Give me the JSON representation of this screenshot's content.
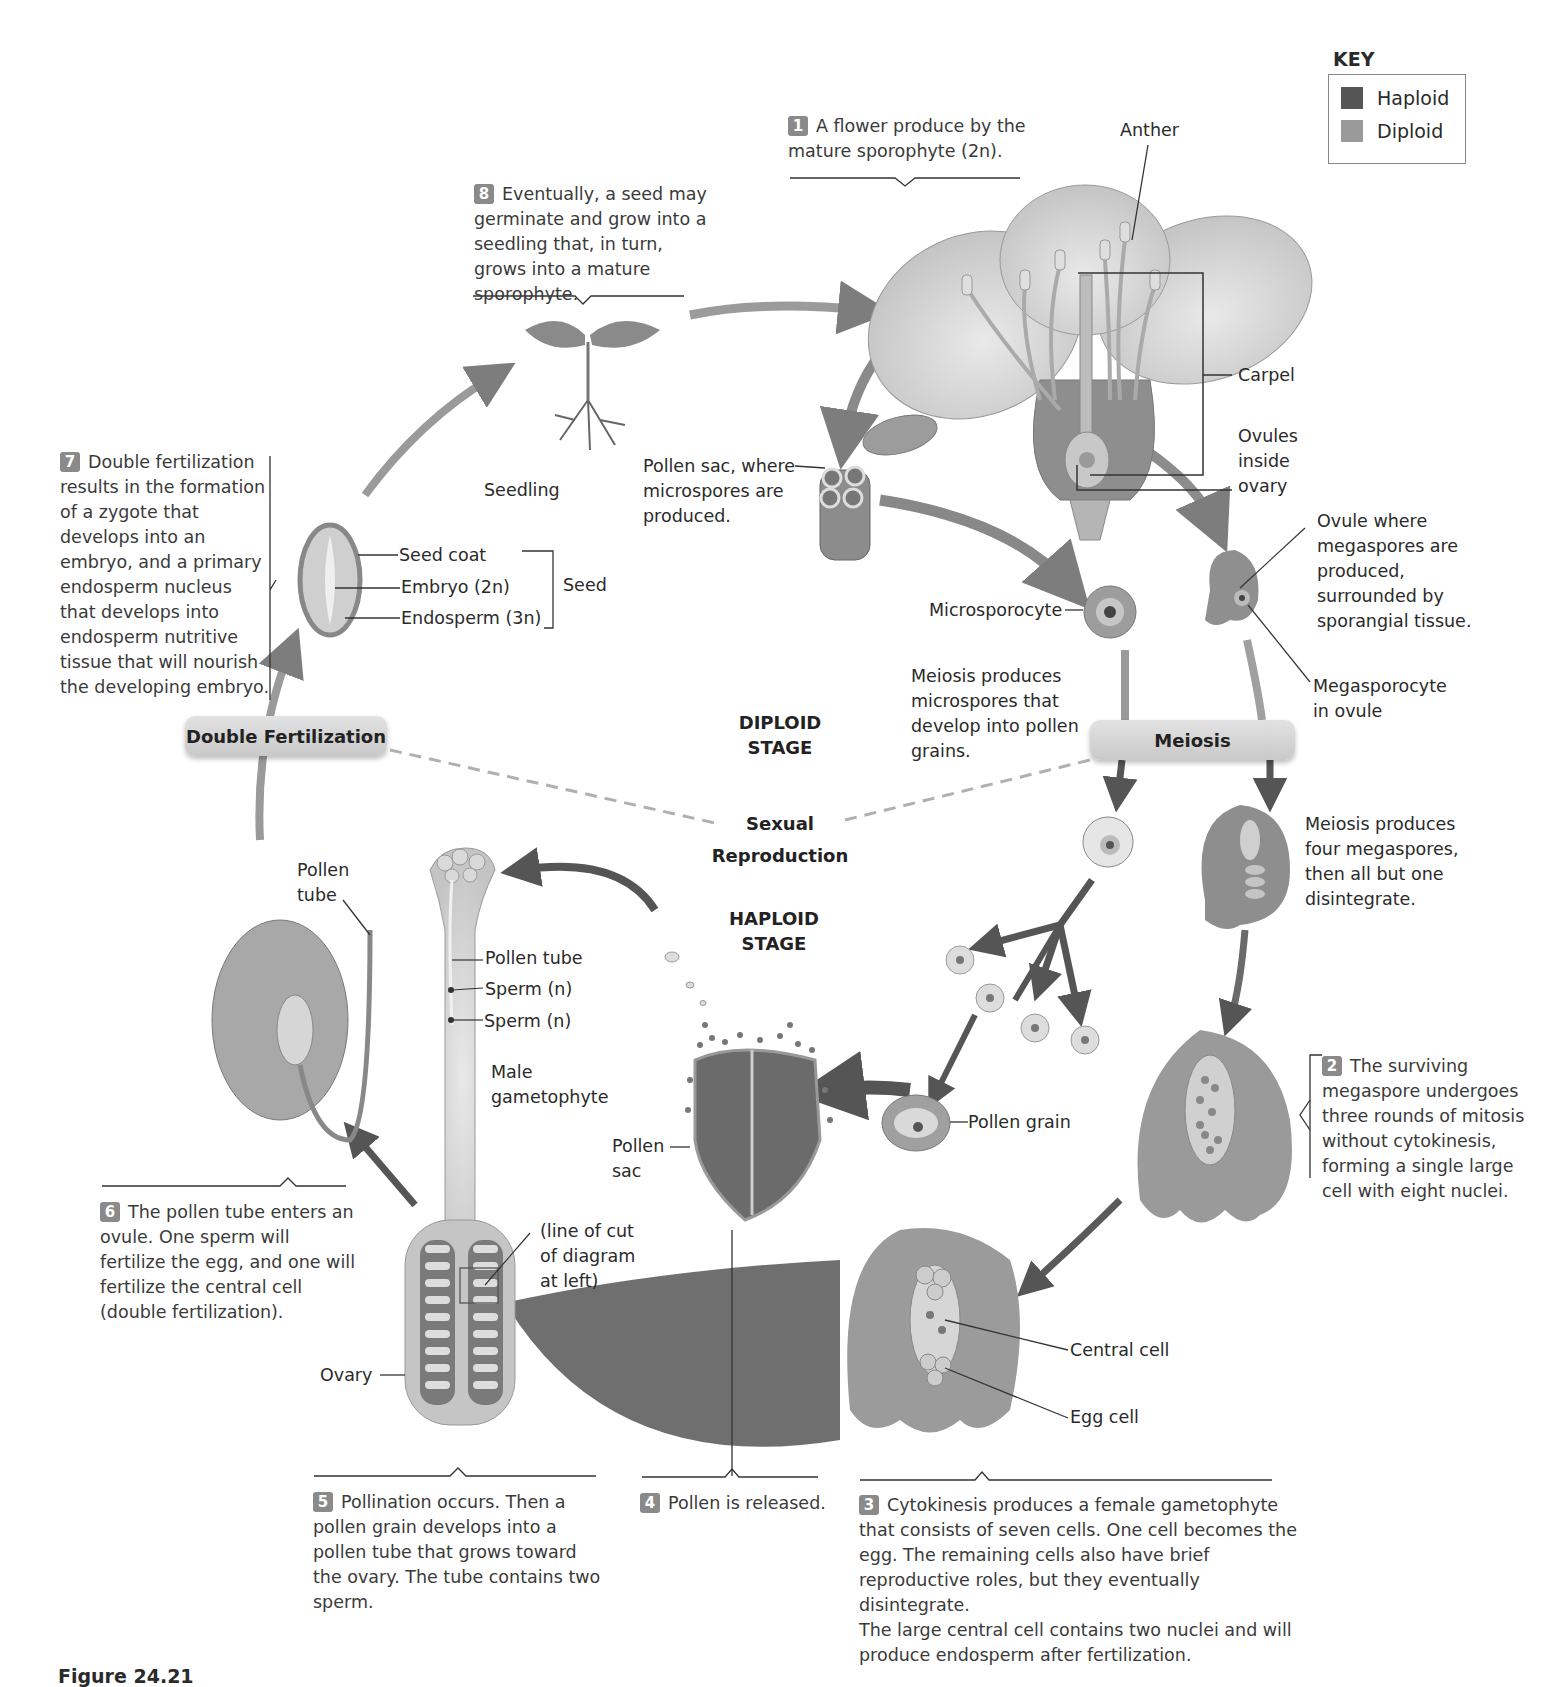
{
  "key": {
    "title": "KEY",
    "items": [
      {
        "label": "Haploid",
        "color": "#555555"
      },
      {
        "label": "Diploid",
        "color": "#9a9a9a"
      }
    ]
  },
  "steps": {
    "s1": {
      "num": "1",
      "text": "A flower produce by the mature sporophyte (2n)."
    },
    "s2": {
      "num": "2",
      "text": "The surviving megaspore undergoes three rounds of mitosis without cytokinesis, forming a single large cell with eight nuclei."
    },
    "s3": {
      "num": "3",
      "text": "Cytokinesis produces a female gametophyte that consists of seven cells. One cell becomes the egg. The remaining cells also have brief reproductive roles, but they eventually disintegrate.",
      "text2": "The large central cell contains two nuclei and will produce endosperm after fertilization."
    },
    "s4": {
      "num": "4",
      "text": "Pollen is released."
    },
    "s5": {
      "num": "5",
      "text": "Pollination occurs. Then a pollen grain develops into a pollen tube that grows toward the ovary. The tube contains two sperm."
    },
    "s6": {
      "num": "6",
      "text": "The pollen tube enters an ovule. One sperm will fertilize the egg, and one will fertilize the central cell (double fertilization)."
    },
    "s7": {
      "num": "7",
      "text": "Double fertilization results in the formation of a zygote that develops into an embryo, and a primary endosperm nucleus that develops into endosperm nutritive tissue that will nourish the developing embryo."
    },
    "s8": {
      "num": "8",
      "text": "Eventually, a seed may germinate and grow into a seedling that, in turn, grows into a mature sporophyte."
    }
  },
  "labels": {
    "anther": "Anther",
    "carpel": "Carpel",
    "ovules_inside_ovary": "Ovules inside ovary",
    "pollen_sac_top": "Pollen sac, where microspores are produced.",
    "seedling": "Seedling",
    "seed_coat": "Seed coat",
    "embryo": "Embryo (2n)",
    "endosperm": "Endosperm (3n)",
    "seed": "Seed",
    "microsporocyte": "Microsporocyte",
    "ovule_where": "Ovule where megaspores are produced, surrounded by sporangial tissue.",
    "megasporocyte": "Megasporocyte in ovule",
    "meiosis_micro": "Meiosis produces microspores that develop into pollen grains.",
    "meiosis_mega": "Meiosis produces four megaspores, then all but one disintegrate.",
    "pollen_tube_left": "Pollen tube",
    "pollen_tube": "Pollen tube",
    "sperm1": "Sperm (n)",
    "sperm2": "Sperm (n)",
    "male_gametophyte": "Male gametophyte",
    "pollen_sac_bottom": "Pollen sac",
    "pollen_grain": "Pollen grain",
    "line_of_cut": "(line of cut of diagram at left)",
    "ovary": "Ovary",
    "central_cell": "Central cell",
    "egg_cell": "Egg cell"
  },
  "stages": {
    "diploid": "DIPLOID STAGE",
    "sexual": "Sexual Reproduction",
    "haploid": "HAPLOID STAGE"
  },
  "pills": {
    "double_fertilization": "Double Fertilization",
    "meiosis": "Meiosis"
  },
  "figure_label": "Figure 24.21"
}
